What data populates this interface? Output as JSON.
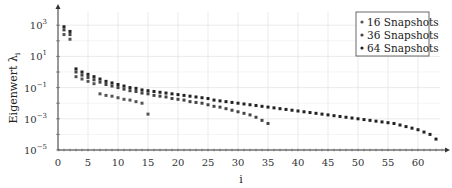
{
  "chart_data": {
    "type": "scatter",
    "title": "",
    "xlabel": "i",
    "ylabel": "Eigenwert λ_i",
    "ylabel_main": "Eigenwert λ",
    "ylabel_sub": "i",
    "xlim": [
      0,
      64
    ],
    "ylim_log10": [
      -5,
      4
    ],
    "yscale": "log",
    "grid": true,
    "legend_position": "upper right",
    "x_ticks": [
      0,
      5,
      10,
      15,
      20,
      25,
      30,
      35,
      40,
      45,
      50,
      55,
      60
    ],
    "y_ticks": [
      {
        "exp": 3,
        "label": "10",
        "sup": "3"
      },
      {
        "exp": 1,
        "label": "10",
        "sup": "1"
      },
      {
        "exp": -1,
        "label": "10",
        "sup": "−1"
      },
      {
        "exp": -3,
        "label": "10",
        "sup": "−3"
      },
      {
        "exp": -5,
        "label": "10",
        "sup": "−5"
      }
    ],
    "series": [
      {
        "name": "16 Snapshots",
        "color": "#555555",
        "x": [
          1,
          2,
          3,
          4,
          5,
          6,
          7,
          8,
          9,
          10,
          11,
          12,
          13,
          14,
          15
        ],
        "log10_values": [
          2.4,
          2.1,
          -0.3,
          -0.45,
          -0.6,
          -0.75,
          -1.4,
          -1.5,
          -1.55,
          -1.65,
          -1.75,
          -1.8,
          -1.9,
          -2.0,
          -2.7
        ]
      },
      {
        "name": "36 Snapshots",
        "color": "#444444",
        "x": [
          1,
          2,
          3,
          4,
          5,
          6,
          7,
          8,
          9,
          10,
          11,
          12,
          13,
          14,
          15,
          16,
          17,
          18,
          19,
          20,
          21,
          22,
          23,
          24,
          25,
          26,
          27,
          28,
          29,
          30,
          31,
          32,
          33,
          34,
          35
        ],
        "log10_values": [
          2.7,
          2.4,
          0.0,
          -0.2,
          -0.35,
          -0.5,
          -0.65,
          -0.8,
          -0.9,
          -1.0,
          -1.1,
          -1.2,
          -1.25,
          -1.35,
          -1.4,
          -1.5,
          -1.55,
          -1.6,
          -1.7,
          -1.75,
          -1.8,
          -1.9,
          -1.95,
          -2.0,
          -2.1,
          -2.2,
          -2.25,
          -2.35,
          -2.45,
          -2.55,
          -2.65,
          -2.75,
          -2.9,
          -3.1,
          -3.3
        ]
      },
      {
        "name": "64 Snapshots",
        "color": "#222222",
        "x": [
          1,
          2,
          3,
          4,
          5,
          6,
          7,
          8,
          9,
          10,
          11,
          12,
          13,
          14,
          15,
          16,
          17,
          18,
          19,
          20,
          21,
          22,
          23,
          24,
          25,
          26,
          27,
          28,
          29,
          30,
          31,
          32,
          33,
          34,
          35,
          36,
          37,
          38,
          39,
          40,
          41,
          42,
          43,
          44,
          45,
          46,
          47,
          48,
          49,
          50,
          51,
          52,
          53,
          54,
          55,
          56,
          57,
          58,
          59,
          60,
          61,
          62,
          63
        ],
        "log10_values": [
          2.9,
          2.6,
          0.2,
          0.0,
          -0.15,
          -0.3,
          -0.45,
          -0.6,
          -0.7,
          -0.8,
          -0.9,
          -1.0,
          -1.05,
          -1.15,
          -1.2,
          -1.25,
          -1.3,
          -1.35,
          -1.4,
          -1.45,
          -1.5,
          -1.55,
          -1.6,
          -1.65,
          -1.7,
          -1.8,
          -1.85,
          -1.9,
          -1.95,
          -2.0,
          -2.05,
          -2.1,
          -2.15,
          -2.2,
          -2.25,
          -2.3,
          -2.35,
          -2.4,
          -2.45,
          -2.5,
          -2.55,
          -2.6,
          -2.65,
          -2.7,
          -2.75,
          -2.8,
          -2.85,
          -2.9,
          -2.95,
          -3.0,
          -3.05,
          -3.1,
          -3.15,
          -3.2,
          -3.25,
          -3.3,
          -3.4,
          -3.5,
          -3.6,
          -3.7,
          -3.85,
          -4.0,
          -4.3
        ]
      }
    ]
  },
  "legend": {
    "items": [
      {
        "label": "16 Snapshots"
      },
      {
        "label": "36 Snapshots"
      },
      {
        "label": "64 Snapshots"
      }
    ]
  }
}
